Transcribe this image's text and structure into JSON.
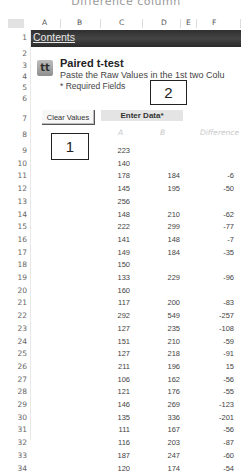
{
  "page_header_clipped": "Difference  column",
  "columns": [
    "A",
    "B",
    "C",
    "D",
    "E",
    "F"
  ],
  "contents_link": "Contents",
  "tool": {
    "icon_glyph": "tt",
    "title": "Paired t-test",
    "subtitle": "Paste the Raw Values in the 1st two Colu",
    "required_note": "* Required Fields"
  },
  "clear_button": "Clear Values",
  "enter_data_header": "Enter Data*",
  "table_headers": {
    "a": "A",
    "b": "B",
    "diff": "Difference"
  },
  "row_numbers": [
    1,
    2,
    3,
    4,
    5,
    6,
    7,
    8,
    9,
    10,
    11,
    12,
    13,
    14,
    15,
    16,
    17,
    18,
    19,
    20,
    21,
    22,
    23,
    24,
    25,
    26,
    27,
    28,
    29,
    30,
    31,
    32,
    33,
    34
  ],
  "rows": [
    {
      "row": 9,
      "a": "223",
      "b": "",
      "diff": ""
    },
    {
      "row": 10,
      "a": "140",
      "b": "",
      "diff": ""
    },
    {
      "row": 11,
      "a": "178",
      "b": "184",
      "diff": "-6"
    },
    {
      "row": 12,
      "a": "145",
      "b": "195",
      "diff": "-50"
    },
    {
      "row": 13,
      "a": "256",
      "b": "",
      "diff": ""
    },
    {
      "row": 14,
      "a": "148",
      "b": "210",
      "diff": "-62"
    },
    {
      "row": 15,
      "a": "222",
      "b": "299",
      "diff": "-77"
    },
    {
      "row": 16,
      "a": "141",
      "b": "148",
      "diff": "-7"
    },
    {
      "row": 17,
      "a": "149",
      "b": "184",
      "diff": "-35"
    },
    {
      "row": 18,
      "a": "150",
      "b": "",
      "diff": ""
    },
    {
      "row": 19,
      "a": "133",
      "b": "229",
      "diff": "-96"
    },
    {
      "row": 20,
      "a": "160",
      "b": "",
      "diff": ""
    },
    {
      "row": 21,
      "a": "117",
      "b": "200",
      "diff": "-83"
    },
    {
      "row": 22,
      "a": "292",
      "b": "549",
      "diff": "-257"
    },
    {
      "row": 23,
      "a": "127",
      "b": "235",
      "diff": "-108"
    },
    {
      "row": 24,
      "a": "151",
      "b": "210",
      "diff": "-59"
    },
    {
      "row": 25,
      "a": "127",
      "b": "218",
      "diff": "-91"
    },
    {
      "row": 26,
      "a": "211",
      "b": "196",
      "diff": "15"
    },
    {
      "row": 27,
      "a": "106",
      "b": "162",
      "diff": "-56"
    },
    {
      "row": 28,
      "a": "121",
      "b": "176",
      "diff": "-55"
    },
    {
      "row": 29,
      "a": "146",
      "b": "269",
      "diff": "-123"
    },
    {
      "row": 30,
      "a": "135",
      "b": "336",
      "diff": "-201"
    },
    {
      "row": 31,
      "a": "111",
      "b": "167",
      "diff": "-56"
    },
    {
      "row": 32,
      "a": "116",
      "b": "203",
      "diff": "-87"
    },
    {
      "row": 33,
      "a": "187",
      "b": "247",
      "diff": "-60"
    },
    {
      "row": 34,
      "a": "120",
      "b": "174",
      "diff": "-54"
    }
  ],
  "callouts": {
    "one": "1",
    "two": "2"
  }
}
